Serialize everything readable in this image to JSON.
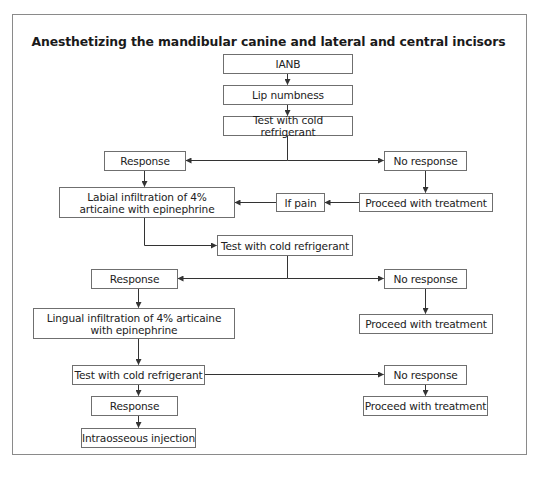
{
  "title": "Anesthetizing the mandibular canine and lateral and central incisors",
  "nodes": {
    "ianb": "IANB",
    "lip_numbness": "Lip numbness",
    "test1": "Test with cold refrigerant",
    "response1": "Response",
    "no_response1": "No response",
    "labial_infiltration": "Labial infiltration of 4% articaine with epinephrine",
    "if_pain": "If pain",
    "proceed1": "Proceed with treatment",
    "test2": "Test with cold refrigerant",
    "response2": "Response",
    "no_response2": "No response",
    "lingual_infiltration": "Lingual infiltration of 4% articaine with epinephrine",
    "proceed2": "Proceed with treatment",
    "test3": "Test with cold refrigerant",
    "no_response3": "No response",
    "response3": "Response",
    "proceed3": "Proceed with treatment",
    "intraosseous": "Intraosseous injection"
  },
  "edges": [
    [
      "ianb",
      "lip_numbness"
    ],
    [
      "lip_numbness",
      "test1"
    ],
    [
      "test1",
      "response1"
    ],
    [
      "test1",
      "no_response1"
    ],
    [
      "response1",
      "labial_infiltration"
    ],
    [
      "no_response1",
      "proceed1"
    ],
    [
      "proceed1",
      "if_pain"
    ],
    [
      "if_pain",
      "labial_infiltration"
    ],
    [
      "labial_infiltration",
      "test2"
    ],
    [
      "test2",
      "response2"
    ],
    [
      "test2",
      "no_response2"
    ],
    [
      "response2",
      "lingual_infiltration"
    ],
    [
      "no_response2",
      "proceed2"
    ],
    [
      "lingual_infiltration",
      "test3"
    ],
    [
      "test3",
      "no_response3"
    ],
    [
      "test3",
      "response3"
    ],
    [
      "no_response3",
      "proceed3"
    ],
    [
      "response3",
      "intraosseous"
    ]
  ],
  "colors": {
    "line": "#333333",
    "box_border": "#6f6f6f",
    "frame_border": "#8a8a8a"
  }
}
